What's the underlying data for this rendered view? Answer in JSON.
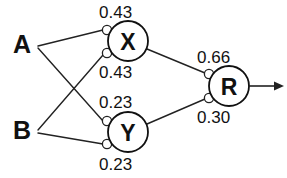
{
  "diagram": {
    "type": "neural-network",
    "title": "",
    "inputs": [
      {
        "id": "A",
        "label": "A",
        "x": 22,
        "y": 44
      },
      {
        "id": "B",
        "label": "B",
        "x": 22,
        "y": 130
      }
    ],
    "nodes": [
      {
        "id": "X",
        "label": "X",
        "cx": 128,
        "cy": 41,
        "r": 20
      },
      {
        "id": "Y",
        "label": "Y",
        "cx": 128,
        "cy": 132,
        "r": 20
      },
      {
        "id": "R",
        "label": "R",
        "cx": 229,
        "cy": 86,
        "r": 20
      }
    ],
    "synapses": [
      {
        "id": "X-in-top",
        "cx": 107,
        "cy": 30,
        "r": 4.6,
        "weight": "0.43"
      },
      {
        "id": "X-in-bot",
        "cx": 107,
        "cy": 53,
        "r": 4.6,
        "weight": "0.43"
      },
      {
        "id": "Y-in-top",
        "cx": 107,
        "cy": 121,
        "r": 4.6,
        "weight": "0.23"
      },
      {
        "id": "Y-in-bot",
        "cx": 107,
        "cy": 144,
        "r": 4.6,
        "weight": "0.23"
      },
      {
        "id": "R-in-top",
        "cx": 209,
        "cy": 74,
        "r": 4.6,
        "weight": "0.66"
      },
      {
        "id": "R-in-bot",
        "cx": 209,
        "cy": 98,
        "r": 4.6,
        "weight": "0.30"
      }
    ],
    "weights": [
      {
        "id": "w-ax",
        "value": "0.43",
        "x": 99,
        "y": 12,
        "for": "A-to-X"
      },
      {
        "id": "w-bx",
        "value": "0.43",
        "x": 99,
        "y": 72,
        "for": "B-to-X"
      },
      {
        "id": "w-ay",
        "value": "0.23",
        "x": 99,
        "y": 102,
        "for": "A-to-Y"
      },
      {
        "id": "w-by",
        "value": "0.23",
        "x": 99,
        "y": 164,
        "for": "B-to-Y"
      },
      {
        "id": "w-xr",
        "value": "0.66",
        "x": 197,
        "y": 57,
        "for": "X-to-R"
      },
      {
        "id": "w-yr",
        "value": "0.30",
        "x": 197,
        "y": 117,
        "for": "Y-to-R"
      }
    ],
    "edges": [
      {
        "id": "A-to-X",
        "from": "A",
        "to": "X-in-top",
        "x1": 38,
        "y1": 46,
        "x2": 103,
        "y2": 30
      },
      {
        "id": "A-to-Y",
        "from": "A",
        "to": "Y-in-top",
        "x1": 38,
        "y1": 48,
        "x2": 103,
        "y2": 121
      },
      {
        "id": "B-to-X",
        "from": "B",
        "to": "X-in-bot",
        "x1": 38,
        "y1": 130,
        "x2": 103,
        "y2": 55
      },
      {
        "id": "B-to-Y",
        "from": "B",
        "to": "Y-in-bot",
        "x1": 38,
        "y1": 133,
        "x2": 103,
        "y2": 144
      },
      {
        "id": "X-to-R",
        "from": "X",
        "to": "R-in-top",
        "x1": 147,
        "y1": 49,
        "x2": 205,
        "y2": 73
      },
      {
        "id": "Y-to-R",
        "from": "Y",
        "to": "R-in-bot",
        "x1": 147,
        "y1": 124,
        "x2": 205,
        "y2": 99
      }
    ],
    "output": {
      "id": "R-output",
      "label": "",
      "line": {
        "x1": 249,
        "y1": 86,
        "x2": 274,
        "y2": 86
      },
      "arrow": {
        "x": 274,
        "y": 86,
        "size": 9
      }
    },
    "colors": {
      "stroke": "#222222",
      "text": "#111111",
      "background": "#ffffff",
      "node_fill": "#ffffff"
    }
  }
}
